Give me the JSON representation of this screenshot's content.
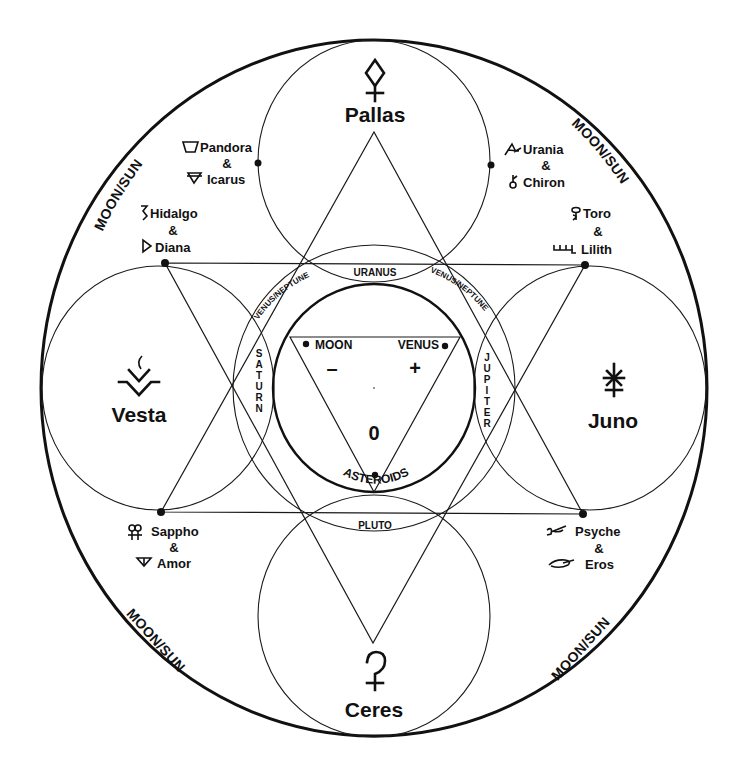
{
  "diagram": {
    "outer_ring_labels": [
      "MOON/SUN",
      "MOON/SUN",
      "MOON/SUN",
      "MOON/SUN"
    ],
    "major_asteroids": [
      {
        "name": "Pallas",
        "glyph": "pallas-glyph",
        "position": "top"
      },
      {
        "name": "Vesta",
        "glyph": "vesta-glyph",
        "position": "left"
      },
      {
        "name": "Juno",
        "glyph": "juno-glyph",
        "position": "right"
      },
      {
        "name": "Ceres",
        "glyph": "ceres-glyph",
        "position": "bottom"
      }
    ],
    "minor_pairs": [
      {
        "first": "Pandora",
        "joiner": "&",
        "second": "Icarus",
        "position": "upper-left-inner"
      },
      {
        "first": "Urania",
        "joiner": "&",
        "second": "Chiron",
        "position": "upper-right-inner"
      },
      {
        "first": "Hidalgo",
        "joiner": "&",
        "second": "Diana",
        "position": "upper-left-outer"
      },
      {
        "first": "Toro",
        "joiner": "&",
        "second": "Lilith",
        "position": "upper-right-outer"
      },
      {
        "first": "Sappho",
        "joiner": "&",
        "second": "Amor",
        "position": "lower-left"
      },
      {
        "first": "Psyche",
        "joiner": "&",
        "second": "Eros",
        "position": "lower-right"
      }
    ],
    "lens_labels": {
      "top": "URANUS",
      "bottom": "PLUTO",
      "left": "SATURN",
      "right": "JUPITER",
      "upper_left": "VENUS/NEPTUNE",
      "upper_right": "VENUS/NEPTUNE"
    },
    "center": {
      "left_point": "MOON",
      "right_point": "VENUS",
      "left_sign": "–",
      "right_sign": "+",
      "bottom_value": "0",
      "bottom_label": "ASTEROIDS"
    },
    "colors": {
      "ink": "#111111",
      "paper": "#ffffff"
    }
  }
}
